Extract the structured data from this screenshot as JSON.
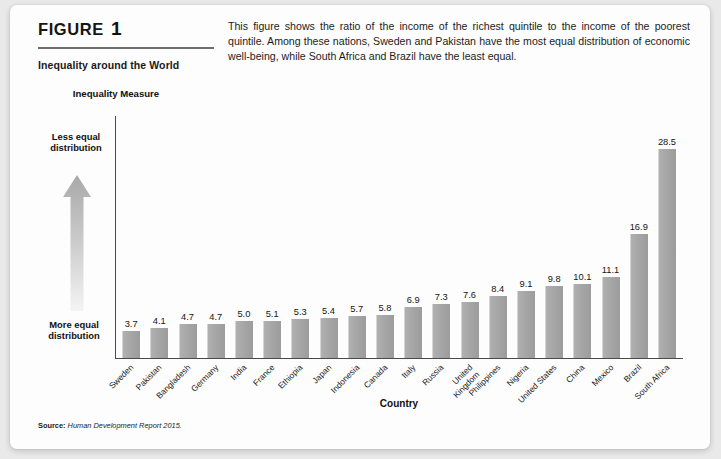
{
  "header": {
    "figure_word": "FIGURE",
    "figure_number": "1",
    "subtitle": "Inequality around the World",
    "description": "This figure shows the ratio of the income of the richest quintile to the income of the poorest quintile. Among these nations, Sweden and Pakistan have the most equal distribution of economic well-being, while South Africa and Brazil have the least equal."
  },
  "annotations": {
    "y_axis_title": "Inequality Measure",
    "less_equal": "Less equal distribution",
    "more_equal": "More equal distribution",
    "arrow_icon": "up-arrow-icon"
  },
  "source": {
    "label": "Source:",
    "text": "Human Development Report 2015."
  },
  "colors": {
    "bar": "#a6a6a6",
    "axis": "#4a4a4a",
    "rule": "#6e6e6e",
    "card": "#fdfdfd",
    "page": "#e9e9e9"
  },
  "chart_data": {
    "type": "bar",
    "title": "Inequality around the World",
    "xlabel": "Country",
    "ylabel": "Inequality Measure",
    "grid": false,
    "legend": "none",
    "ylim": [
      0,
      30
    ],
    "categories": [
      "Sweden",
      "Pakistan",
      "Bangladesh",
      "Germany",
      "India",
      "France",
      "Ethiopia",
      "Japan",
      "Indonesia",
      "Canada",
      "Italy",
      "Russia",
      "United Kingdom",
      "Philippines",
      "Nigeria",
      "United States",
      "China",
      "Mexico",
      "Brazil",
      "South Africa"
    ],
    "values": [
      3.7,
      4.1,
      4.7,
      4.7,
      5.0,
      5.1,
      5.3,
      5.4,
      5.7,
      5.8,
      6.9,
      7.3,
      7.6,
      8.4,
      9.1,
      9.8,
      10.1,
      11.1,
      16.9,
      28.5
    ],
    "value_labels": [
      "3.7",
      "4.1",
      "4.7",
      "4.7",
      "5.0",
      "5.1",
      "5.3",
      "5.4",
      "5.7",
      "5.8",
      "6.9",
      "7.3",
      "7.6",
      "8.4",
      "9.1",
      "9.8",
      "10.1",
      "11.1",
      "16.9",
      "28.5"
    ],
    "annotations": [
      "Less equal distribution",
      "More equal distribution"
    ]
  }
}
